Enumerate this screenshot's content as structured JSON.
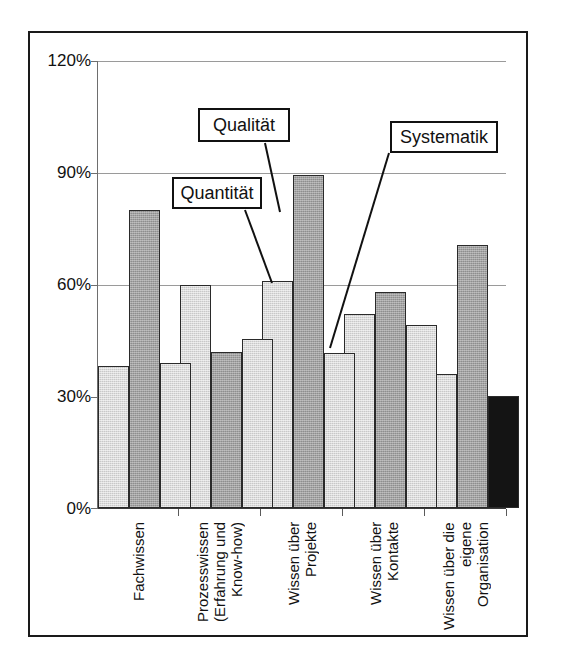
{
  "chart_data": {
    "type": "bar",
    "title": "",
    "subtitle": "",
    "xlabel": "",
    "ylabel": "",
    "ylim": [
      0,
      120
    ],
    "ytick_labels": [
      "0%",
      "30%",
      "60%",
      "90%",
      "120%"
    ],
    "ytick_values": [
      0,
      30,
      60,
      90,
      120
    ],
    "grid": true,
    "legend_position": "none",
    "categories": [
      "Fachwissen",
      "Prozesswissen\n(Erfahrung und\nKnow-how)",
      "Wissen über\nProjekte",
      "Wissen über\nKontakte",
      "Wissen über die\neigene\nOrganisation"
    ],
    "category_lines": [
      [
        "Fachwissen"
      ],
      [
        "Prozesswissen",
        "(Erfahrung und",
        "Know-how)"
      ],
      [
        "Wissen über",
        "Projekte"
      ],
      [
        "Wissen über",
        "Kontakte"
      ],
      [
        "Wissen über die",
        "eigene",
        "Organisation"
      ]
    ],
    "series": [
      {
        "name": "Quantität",
        "style": "light",
        "values": [
          38,
          60,
          61,
          52,
          36
        ]
      },
      {
        "name": "Qualität",
        "style": "mid",
        "values": [
          80,
          42,
          89.5,
          58,
          70.5
        ]
      },
      {
        "name": "Systematik",
        "style": "light",
        "values": [
          39,
          45.5,
          41.5,
          49,
          30
        ],
        "value_styles": [
          "light",
          "light",
          "light",
          "light",
          "dark"
        ]
      }
    ],
    "annotations": [
      {
        "text": "Quantität",
        "box": true
      },
      {
        "text": "Qualität",
        "box": true
      },
      {
        "text": "Systematik",
        "box": true
      }
    ]
  },
  "colors": {
    "bar_light": "#c8c8c8",
    "bar_mid": "#8e8e8e",
    "bar_dark": "#141414",
    "grid": "#9a9a9a",
    "axis": "#3a3a3a",
    "frame": "#1a1a1a",
    "text": "#111111",
    "background": "#ffffff"
  }
}
